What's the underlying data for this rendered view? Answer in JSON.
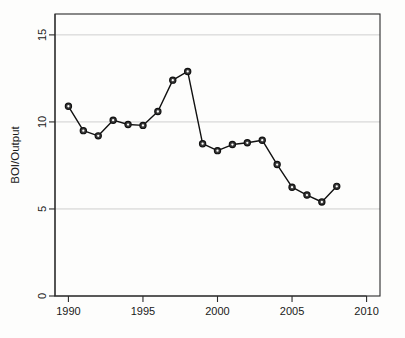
{
  "chart_data": {
    "type": "line",
    "title": "",
    "subtitle": "",
    "xlabel": "",
    "ylabel": "BOI/Output",
    "x": [
      1990,
      1991,
      1992,
      1993,
      1994,
      1995,
      1996,
      1997,
      1998,
      1999,
      2000,
      2001,
      2002,
      2003,
      2004,
      2005,
      2006,
      2007,
      2008
    ],
    "values": [
      10.9,
      9.5,
      9.2,
      10.1,
      9.85,
      9.8,
      10.6,
      12.4,
      12.9,
      8.75,
      8.35,
      8.7,
      8.8,
      8.95,
      7.55,
      6.25,
      5.8,
      5.4,
      6.3
    ],
    "series": [
      {
        "name": "BOI/Output",
        "values": [
          10.9,
          9.5,
          9.2,
          10.1,
          9.85,
          9.8,
          10.6,
          12.4,
          12.9,
          8.75,
          8.35,
          8.7,
          8.8,
          8.95,
          7.55,
          6.25,
          5.8,
          5.4,
          6.3
        ]
      }
    ],
    "xlim": [
      1989.1,
      2010.9
    ],
    "ylim": [
      0,
      16.2
    ],
    "xticks": [
      1990,
      1995,
      2000,
      2005,
      2010
    ],
    "xtick_labels": [
      "1990",
      "1995",
      "2000",
      "2005",
      "2010"
    ],
    "yticks": [
      0,
      5,
      10,
      15
    ],
    "ytick_labels": [
      "0",
      "5",
      "10",
      "15"
    ],
    "gridlines": [
      5,
      10,
      15
    ],
    "grid": true,
    "legend": null,
    "legend_position": "none",
    "marker": "circle-open",
    "line_color": "#111111",
    "marker_fill": "#3a3a3a",
    "marker_edge": "#111111",
    "grid_color": "#c9c9c9",
    "axis_color": "#2b2b2b",
    "plot_background": "#fdfdfc",
    "annotations": []
  }
}
